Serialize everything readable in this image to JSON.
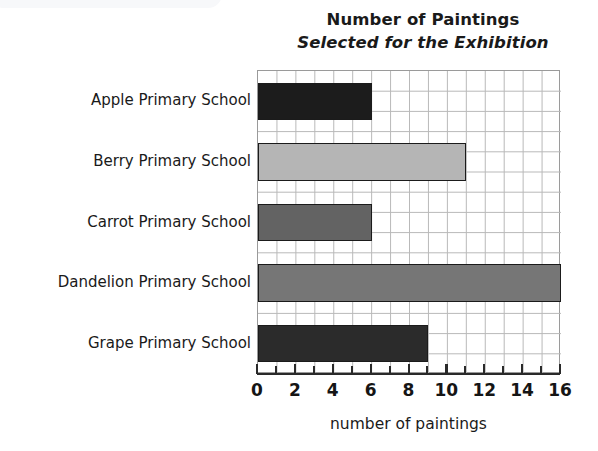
{
  "chart_data": {
    "type": "bar",
    "orientation": "horizontal",
    "title": "Number of Paintings Selected for the Exhibition",
    "title_lines": [
      "Number of Paintings",
      "Selected for the Exhibition"
    ],
    "categories": [
      "Apple Primary School",
      "Berry Primary School",
      "Carrot Primary School",
      "Dandelion Primary School",
      "Grape Primary School"
    ],
    "values": [
      6,
      11,
      6,
      16,
      9
    ],
    "bar_colors": [
      "#1c1c1c",
      "#b5b5b5",
      "#636363",
      "#767676",
      "#2b2b2b"
    ],
    "xlabel": "number of paintings",
    "ylabel": "",
    "xlim": [
      0,
      16
    ],
    "xticks": [
      0,
      1,
      2,
      3,
      4,
      5,
      6,
      7,
      8,
      9,
      10,
      11,
      12,
      13,
      14,
      15,
      16
    ],
    "xtick_labels": [
      "0",
      "",
      "2",
      "",
      "4",
      "",
      "6",
      "",
      "8",
      "",
      "10",
      "",
      "12",
      "",
      "14",
      "",
      "16"
    ],
    "xtick_labels_major": [
      "0",
      "2",
      "4",
      "6",
      "8",
      "10",
      "12",
      "14",
      "16"
    ],
    "grid": true,
    "legend": false
  }
}
